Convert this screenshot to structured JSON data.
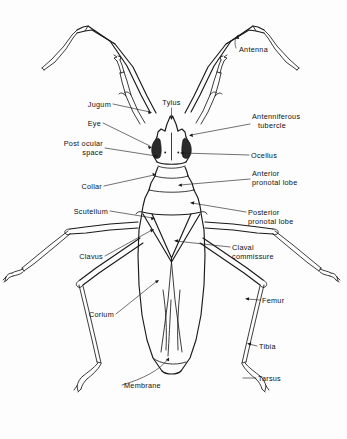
{
  "figure": {
    "background_color": "#fdfdfd",
    "ink_color": "#1a1a1a",
    "width": 347,
    "height": 439
  },
  "labels": {
    "antenna": "Antenna",
    "tylus": "Tylus",
    "jugum": "Jugum",
    "eye": "Eye",
    "post_ocular_space_line1": "Post ocular",
    "post_ocular_space_line2": "space",
    "collar": "Collar",
    "scutellum": "Scutellum",
    "clavus": "Clavus",
    "corium": "Corium",
    "membrane": "Membrane",
    "antenniferous_tubercle_line1": "Antenniferous",
    "antenniferous_tubercle_line2": "tubercle",
    "ocellus": "Ocellus",
    "anterior_pronotal_lobe_line1": "Anterior",
    "anterior_pronotal_lobe_line2": "pronotal lobe",
    "posterior_pronotal_lobe_line1": "Posterior",
    "posterior_pronotal_lobe_line2": "pronotal lobe",
    "claval_commissure_line1": "Claval",
    "claval_commissure_line2": "commissure",
    "femur": "Femur",
    "tibia": "Tibia",
    "tarsus": "Tarsus"
  }
}
